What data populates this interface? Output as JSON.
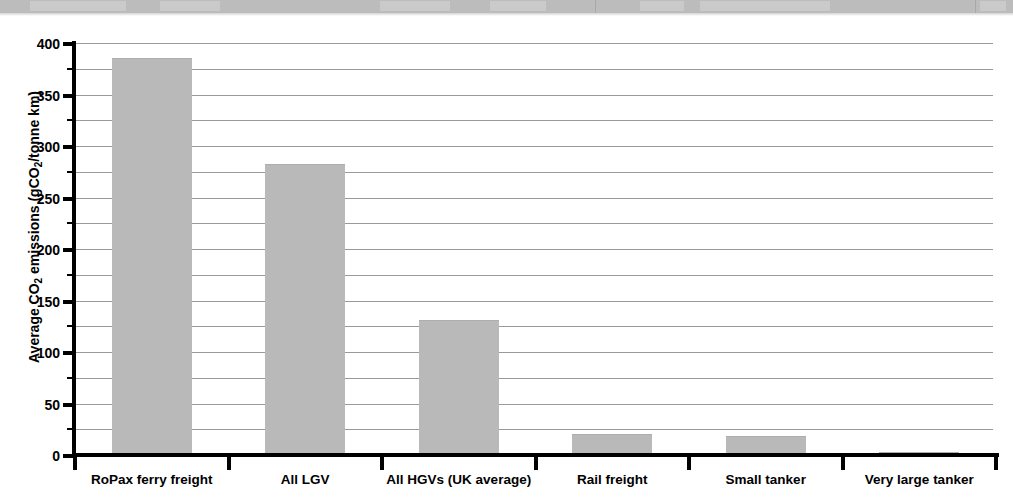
{
  "chart_data": {
    "type": "bar",
    "title": "",
    "xlabel": "",
    "ylabel": "Average CO2 emissions (gCO2/tonne km)",
    "ylabel_parts": {
      "prefix": "Average CO",
      "sub1": "2",
      "middle": " emissions (gCO",
      "sub2": "2",
      "suffix": "/tonne km)"
    },
    "categories": [
      "RoPax ferry freight",
      "All LGV",
      "All HGVs (UK average)",
      "Rail freight",
      "Small tanker",
      "Very large tanker"
    ],
    "values": [
      385,
      283,
      131,
      20,
      18,
      3
    ],
    "ylim": [
      0,
      400
    ],
    "ytick_major": [
      0,
      50,
      100,
      150,
      200,
      250,
      300,
      350,
      400
    ],
    "ytick_major_labels": [
      "0",
      "50",
      "100",
      "150",
      "200",
      "250",
      "300",
      "350",
      "400"
    ],
    "ytick_minor": [
      25,
      75,
      125,
      175,
      225,
      275,
      325,
      375
    ],
    "gridlines": [
      25,
      50,
      75,
      100,
      125,
      150,
      175,
      200,
      225,
      250,
      275,
      300,
      325,
      350,
      375,
      400
    ],
    "grid": true,
    "legend": null,
    "legend_position": "none",
    "colors": {
      "bar_fill": "#b9b9b9",
      "bar_edge": "#adadad",
      "gridline": "#9a9a9a",
      "axis": "#000000",
      "text": "#000000",
      "background": "#ffffff",
      "scan_band": "#bcbcbc"
    },
    "annotations": []
  },
  "figure": {
    "scan_band_present": true,
    "scan_band_note": ""
  }
}
